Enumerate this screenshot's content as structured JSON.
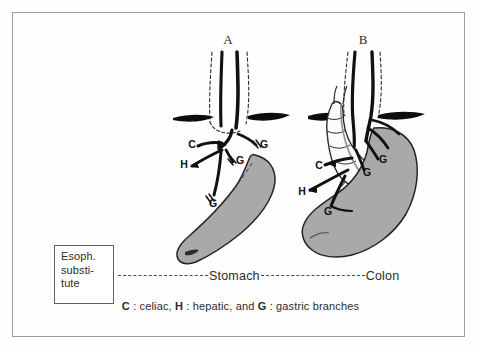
{
  "figure": {
    "panels": [
      {
        "id": "A",
        "letter": "A",
        "name": "panel-a-stomach-pull-up"
      },
      {
        "id": "B",
        "letter": "B",
        "name": "panel-b-colon-interposition"
      }
    ],
    "legend_box": {
      "lines": [
        "Esoph.",
        "substi-",
        "tute"
      ]
    },
    "row": {
      "dash_left": "-----------",
      "label_stomach": "Stomach",
      "dash_middle": "--------------",
      "label_colon": "Colon"
    },
    "caption": {
      "c_key": "C",
      "c_sep": " : ",
      "c_text": "celiac, ",
      "h_key": "H",
      "h_sep": " : ",
      "h_text": "hepatic, and ",
      "g_key": "G",
      "g_sep": " : ",
      "g_text": "gastric branches",
      "full": "C : celiac, H : hepatic, and G : gastric branches"
    },
    "panel_a_labels": [
      {
        "text": "C",
        "x": 192,
        "y": 148
      },
      {
        "text": "G",
        "x": 264,
        "y": 148
      },
      {
        "text": "H",
        "x": 184,
        "y": 168
      },
      {
        "text": "G",
        "x": 240,
        "y": 164
      },
      {
        "text": "G",
        "x": 213,
        "y": 205
      }
    ],
    "panel_b_labels": [
      {
        "text": "C",
        "x": 321,
        "y": 168
      },
      {
        "text": "G",
        "x": 380,
        "y": 162
      },
      {
        "text": "G",
        "x": 366,
        "y": 174
      },
      {
        "text": "H",
        "x": 303,
        "y": 193
      },
      {
        "text": "G",
        "x": 328,
        "y": 213
      }
    ],
    "colors": {
      "vessel": "#111111",
      "stomach_fill": "#a9a9a9",
      "stomach_outline": "#232323",
      "colon_fill": "#fbfbfb",
      "colon_outline": "#2a2a2a",
      "diaphragm": "#0d0d0d",
      "dashed_outline": "#2b2b2b",
      "border": "#9b9b9b",
      "background": "#fefefe"
    }
  }
}
